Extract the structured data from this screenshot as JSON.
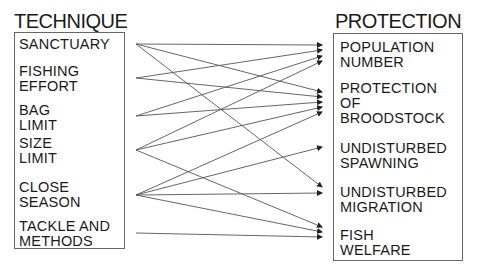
{
  "diagram": {
    "left_title": "TECHNIQUE",
    "right_title": "PROTECTION",
    "techniques": [
      {
        "id": "sanctuary",
        "label": "SANCTUARY"
      },
      {
        "id": "fishing-effort",
        "label": "FISHING\nEFFORT"
      },
      {
        "id": "bag-limit",
        "label": "BAG\nLIMIT"
      },
      {
        "id": "size-limit",
        "label": "SIZE\nLIMIT"
      },
      {
        "id": "close-season",
        "label": "CLOSE\nSEASON"
      },
      {
        "id": "tackle-and-methods",
        "label": "TACKLE AND\nMETHODS"
      }
    ],
    "protections": [
      {
        "id": "population-number",
        "label": "POPULATION\nNUMBER"
      },
      {
        "id": "protection-of-broodstock",
        "label": "PROTECTION\nOF\nBROODSTOCK"
      },
      {
        "id": "undisturbed-spawning",
        "label": "UNDISTURBED\nSPAWNING"
      },
      {
        "id": "undisturbed-migration",
        "label": "UNDISTURBED\nMIGRATION"
      },
      {
        "id": "fish-welfare",
        "label": "FISH\nWELFARE"
      }
    ],
    "links": [
      {
        "from": "SANCTUARY",
        "to": "POPULATION NUMBER"
      },
      {
        "from": "SANCTUARY",
        "to": "PROTECTION OF BROODSTOCK"
      },
      {
        "from": "SANCTUARY",
        "to": "UNDISTURBED MIGRATION"
      },
      {
        "from": "FISHING EFFORT",
        "to": "POPULATION NUMBER"
      },
      {
        "from": "FISHING EFFORT",
        "to": "PROTECTION OF BROODSTOCK"
      },
      {
        "from": "BAG LIMIT",
        "to": "POPULATION NUMBER"
      },
      {
        "from": "BAG LIMIT",
        "to": "PROTECTION OF BROODSTOCK"
      },
      {
        "from": "SIZE LIMIT",
        "to": "POPULATION NUMBER"
      },
      {
        "from": "SIZE LIMIT",
        "to": "PROTECTION OF BROODSTOCK"
      },
      {
        "from": "SIZE LIMIT",
        "to": "FISH WELFARE"
      },
      {
        "from": "CLOSE SEASON",
        "to": "PROTECTION OF BROODSTOCK"
      },
      {
        "from": "CLOSE SEASON",
        "to": "UNDISTURBED SPAWNING"
      },
      {
        "from": "CLOSE SEASON",
        "to": "UNDISTURBED MIGRATION"
      },
      {
        "from": "CLOSE SEASON",
        "to": "FISH WELFARE"
      },
      {
        "from": "TACKLE AND METHODS",
        "to": "FISH WELFARE"
      }
    ]
  }
}
